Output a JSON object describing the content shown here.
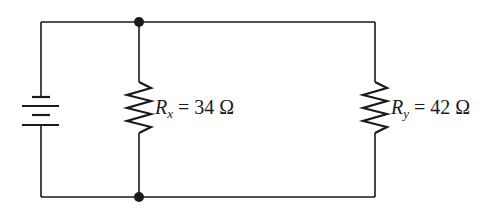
{
  "diagram": {
    "type": "parallel-circuit",
    "source": {
      "name": "battery",
      "symbol": "dc-battery"
    },
    "resistors": [
      {
        "id": "Rx",
        "symbol": "R",
        "subscript": "x",
        "equals": "=",
        "value": "34 Ω",
        "resistance_ohms": 34
      },
      {
        "id": "Ry",
        "symbol": "R",
        "subscript": "y",
        "equals": "=",
        "value": "42 Ω",
        "resistance_ohms": 42
      }
    ],
    "junctions": [
      "top-junction",
      "bottom-junction"
    ],
    "colors": {
      "wire": "#1a1a1a",
      "background": "#ffffff"
    }
  }
}
